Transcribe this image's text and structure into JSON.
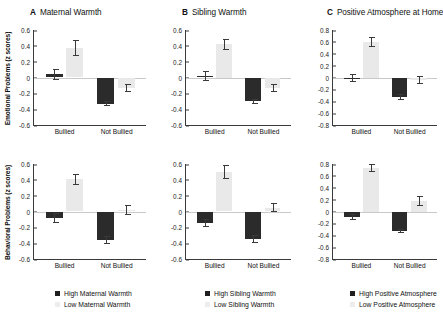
{
  "figure": {
    "bar_colors": {
      "high": "#2b2b2b",
      "low": "#e9e9e9"
    },
    "x_categories": [
      "Bullied",
      "Not Bullied"
    ],
    "y_axis_titles": {
      "top": "Emotional Problems (z scores)",
      "bottom": "Behavioral Problems (z scores)"
    }
  },
  "panels": [
    {
      "letter": "A",
      "title": "Maternal Warmth",
      "legend": {
        "high": "High Maternal Warmth",
        "low": "Low Maternal Warmth"
      },
      "ylim": [
        -0.6,
        0.6
      ],
      "yticks": [
        "0.6",
        "0.4",
        "0.2",
        "0",
        "-0.2",
        "-0.4",
        "-0.6"
      ],
      "charts": [
        {
          "id": "a-emotional",
          "ylabel": "Emotional Problems (z scores)",
          "bullied": {
            "high": 0.04,
            "high_err": 0.07,
            "low": 0.37,
            "low_err": 0.1
          },
          "not_bullied": {
            "high": -0.33,
            "high_err": 0.03,
            "low": -0.13,
            "low_err": 0.05
          }
        },
        {
          "id": "a-behavioral",
          "ylabel": "Behavioral Problems (z scores)",
          "bullied": {
            "high": -0.08,
            "high_err": 0.06,
            "low": 0.41,
            "low_err": 0.07
          },
          "not_bullied": {
            "high": -0.36,
            "high_err": 0.05,
            "low": 0.02,
            "low_err": 0.06
          }
        }
      ]
    },
    {
      "letter": "B",
      "title": "Sibling Warmth",
      "legend": {
        "high": "High Sibling Warmth",
        "low": "Low Sibling Warmth"
      },
      "ylim": [
        -0.6,
        0.6
      ],
      "yticks": [
        "0.6",
        "0.4",
        "0.2",
        "0",
        "-0.2",
        "-0.4",
        "-0.6"
      ],
      "charts": [
        {
          "id": "b-emotional",
          "ylabel": "",
          "bullied": {
            "high": 0.02,
            "high_err": 0.06,
            "low": 0.42,
            "low_err": 0.07
          },
          "not_bullied": {
            "high": -0.3,
            "high_err": 0.03,
            "low": -0.13,
            "low_err": 0.05
          }
        },
        {
          "id": "b-behavioral",
          "ylabel": "",
          "bullied": {
            "high": -0.15,
            "high_err": 0.05,
            "low": 0.5,
            "low_err": 0.09
          },
          "not_bullied": {
            "high": -0.35,
            "high_err": 0.05,
            "low": 0.05,
            "low_err": 0.06
          }
        }
      ]
    },
    {
      "letter": "C",
      "title": "Positive Atmosphere at Home",
      "legend": {
        "high": "High Positive Atmosphere",
        "low": "Low Positive Atmosphere"
      },
      "ylim": [
        -0.8,
        0.8
      ],
      "yticks": [
        "0.8",
        "0.6",
        "0.4",
        "0.2",
        "0",
        "-0.2",
        "-0.4",
        "-0.6",
        "-0.8"
      ],
      "charts": [
        {
          "id": "c-emotional",
          "ylabel": "",
          "bullied": {
            "high": -0.01,
            "high_err": 0.07,
            "low": 0.6,
            "low_err": 0.09
          },
          "not_bullied": {
            "high": -0.33,
            "high_err": 0.05,
            "low": -0.04,
            "low_err": 0.07
          }
        },
        {
          "id": "c-behavioral",
          "ylabel": "",
          "bullied": {
            "high": -0.1,
            "high_err": 0.05,
            "low": 0.73,
            "low_err": 0.07
          },
          "not_bullied": {
            "high": -0.33,
            "high_err": 0.04,
            "low": 0.18,
            "low_err": 0.08
          }
        }
      ]
    }
  ],
  "chart_data": {
    "type": "bar",
    "title": "",
    "xlabel": "",
    "ylabel": "z scores",
    "grid": false,
    "legend_position": "bottom",
    "categories": [
      "Bullied",
      "Not Bullied"
    ],
    "panels": [
      {
        "panel": "A",
        "title": "Maternal Warmth",
        "outcome": "Emotional Problems (z scores)",
        "ylim": [
          -0.6,
          0.6
        ],
        "series": [
          {
            "name": "High Maternal Warmth",
            "values": [
              0.04,
              -0.33
            ],
            "errors": [
              0.07,
              0.03
            ]
          },
          {
            "name": "Low Maternal Warmth",
            "values": [
              0.37,
              -0.13
            ],
            "errors": [
              0.1,
              0.05
            ]
          }
        ]
      },
      {
        "panel": "A",
        "title": "Maternal Warmth",
        "outcome": "Behavioral Problems (z scores)",
        "ylim": [
          -0.6,
          0.6
        ],
        "series": [
          {
            "name": "High Maternal Warmth",
            "values": [
              -0.08,
              -0.36
            ],
            "errors": [
              0.06,
              0.05
            ]
          },
          {
            "name": "Low Maternal Warmth",
            "values": [
              0.41,
              0.02
            ],
            "errors": [
              0.07,
              0.06
            ]
          }
        ]
      },
      {
        "panel": "B",
        "title": "Sibling Warmth",
        "outcome": "Emotional Problems (z scores)",
        "ylim": [
          -0.6,
          0.6
        ],
        "series": [
          {
            "name": "High Sibling Warmth",
            "values": [
              0.02,
              -0.3
            ],
            "errors": [
              0.06,
              0.03
            ]
          },
          {
            "name": "Low Sibling Warmth",
            "values": [
              0.42,
              -0.13
            ],
            "errors": [
              0.07,
              0.05
            ]
          }
        ]
      },
      {
        "panel": "B",
        "title": "Sibling Warmth",
        "outcome": "Behavioral Problems (z scores)",
        "ylim": [
          -0.6,
          0.6
        ],
        "series": [
          {
            "name": "High Sibling Warmth",
            "values": [
              -0.15,
              -0.35
            ],
            "errors": [
              0.05,
              0.05
            ]
          },
          {
            "name": "Low Sibling Warmth",
            "values": [
              0.5,
              0.05
            ],
            "errors": [
              0.09,
              0.06
            ]
          }
        ]
      },
      {
        "panel": "C",
        "title": "Positive Atmosphere at Home",
        "outcome": "Emotional Problems (z scores)",
        "ylim": [
          -0.8,
          0.8
        ],
        "series": [
          {
            "name": "High Positive Atmosphere",
            "values": [
              -0.01,
              -0.33
            ],
            "errors": [
              0.07,
              0.05
            ]
          },
          {
            "name": "Low Positive Atmosphere",
            "values": [
              0.6,
              -0.04
            ],
            "errors": [
              0.09,
              0.07
            ]
          }
        ]
      },
      {
        "panel": "C",
        "title": "Positive Atmosphere at Home",
        "outcome": "Behavioral Problems (z scores)",
        "ylim": [
          -0.8,
          0.8
        ],
        "series": [
          {
            "name": "High Positive Atmosphere",
            "values": [
              -0.1,
              -0.33
            ],
            "errors": [
              0.05,
              0.04
            ]
          },
          {
            "name": "Low Positive Atmosphere",
            "values": [
              0.73,
              0.18
            ],
            "errors": [
              0.07,
              0.08
            ]
          }
        ]
      }
    ]
  }
}
